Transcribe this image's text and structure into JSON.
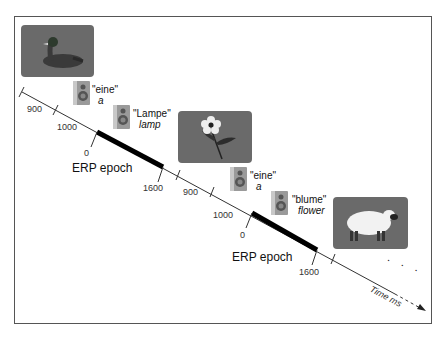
{
  "diagram": {
    "type": "timeline-paradigm",
    "stimuli": [
      {
        "id": "duck",
        "picture": "duck-picture",
        "description": "Photograph of a duck on grey background"
      },
      {
        "id": "flower",
        "picture": "flower-picture",
        "description": "Photograph of a flower on grey background"
      },
      {
        "id": "sheep",
        "picture": "sheep-picture",
        "description": "Photograph of a sheep on grey background"
      }
    ],
    "words": [
      {
        "german": "\"eine\"",
        "english": "a"
      },
      {
        "german": "\"Lampe\"",
        "english": "lamp"
      },
      {
        "german": "\"eine\"",
        "english": "a"
      },
      {
        "german": "\"blume\"",
        "english": "flower"
      }
    ],
    "timeline": {
      "ticks_trial1": [
        "900",
        "1000",
        "0",
        "1600"
      ],
      "ticks_trial2": [
        "900",
        "1000",
        "0",
        "1600"
      ],
      "epoch_label": "ERP epoch",
      "axis_label": "Time ms",
      "continuation": ". . ."
    },
    "colors": {
      "picture_bg": "#6a6a6a",
      "line": "#333333",
      "epoch_bar": "#000000"
    }
  }
}
